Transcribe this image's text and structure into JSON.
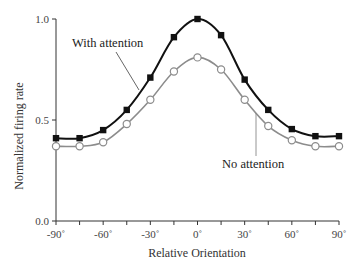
{
  "chart_data": {
    "type": "line",
    "title": "",
    "xlabel": "Relative Orientation",
    "ylabel": "Normalized firing rate",
    "x": [
      -90,
      -75,
      -60,
      -45,
      -30,
      -15,
      0,
      15,
      30,
      45,
      60,
      75,
      90
    ],
    "xticks": [
      -90,
      -60,
      -30,
      0,
      30,
      60,
      90
    ],
    "xtick_labels": [
      "-90˚",
      "-60˚",
      "-30˚",
      "0˚",
      "30˚",
      "60˚",
      "90˚"
    ],
    "xminor_step": 15,
    "yticks": [
      0.0,
      0.5,
      1.0
    ],
    "ytick_labels": [
      "0.0",
      "0.5",
      "1.0"
    ],
    "xlim": [
      -90,
      90
    ],
    "ylim": [
      0,
      1.0
    ],
    "grid": false,
    "legend": "inline annotations",
    "series": [
      {
        "name": "With attention",
        "marker": "filled-square",
        "color": "#111111",
        "values": [
          0.41,
          0.41,
          0.45,
          0.55,
          0.71,
          0.91,
          1.0,
          0.92,
          0.7,
          0.55,
          0.455,
          0.42,
          0.42
        ]
      },
      {
        "name": "No attention",
        "marker": "open-circle",
        "color": "#8c8c8c",
        "values": [
          0.37,
          0.37,
          0.39,
          0.48,
          0.6,
          0.74,
          0.81,
          0.75,
          0.6,
          0.47,
          0.4,
          0.37,
          0.37
        ]
      }
    ],
    "annotations": [
      {
        "text": "With attention",
        "series": "With attention"
      },
      {
        "text": "No attention",
        "series": "No attention"
      }
    ]
  }
}
